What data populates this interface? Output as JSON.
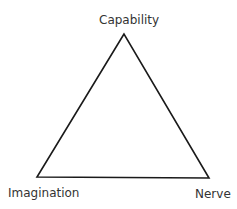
{
  "diagram": {
    "type": "triangle",
    "nodes": {
      "top": "Capability",
      "bottom_left": "Imagination",
      "bottom_right": "Nerve"
    },
    "stroke_color": "#1a1a1a",
    "text_color": "#333333"
  }
}
